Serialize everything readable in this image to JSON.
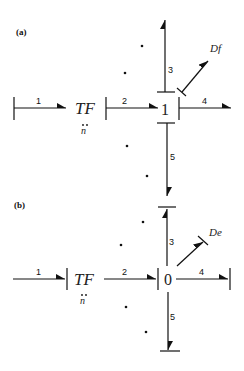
{
  "diagram": {
    "type": "bond-graph",
    "panels": [
      {
        "label": "(a)",
        "transformer": {
          "name": "TF",
          "modulus": "n",
          "modulus_accent": "double-dot"
        },
        "junction": "1",
        "bonds": [
          {
            "number": "1",
            "direction": "right"
          },
          {
            "number": "2",
            "direction": "right"
          },
          {
            "number": "3",
            "direction": "up"
          },
          {
            "number": "4",
            "direction": "right"
          },
          {
            "number": "5",
            "direction": "down"
          }
        ],
        "element": "Df"
      },
      {
        "label": "(b)",
        "transformer": {
          "name": "TF",
          "modulus": "n",
          "modulus_accent": "double-dot"
        },
        "junction": "0",
        "bonds": [
          {
            "number": "1",
            "direction": "right"
          },
          {
            "number": "2",
            "direction": "right"
          },
          {
            "number": "3",
            "direction": "up"
          },
          {
            "number": "4",
            "direction": "right"
          },
          {
            "number": "5",
            "direction": "down"
          }
        ],
        "element": "De"
      }
    ]
  }
}
